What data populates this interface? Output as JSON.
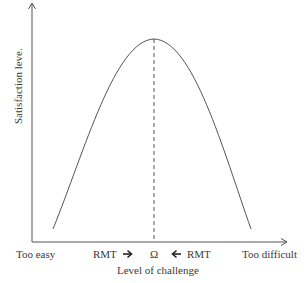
{
  "diagram": {
    "y_axis_label": "Satisfaction leve.",
    "x_axis_label": "Level of challenge",
    "x_left_label": "Too easy",
    "x_right_label": "Too difficult",
    "center_label": "Ω",
    "left_marker_label": "RMT",
    "right_marker_label": "RMT",
    "left_arrow_glyph": "➔",
    "right_arrow_glyph": "🡐",
    "colors": {
      "line": "#555555",
      "text": "#3a3a3a",
      "background": "#ffffff"
    },
    "curve": {
      "shape": "inverted-parabola",
      "peak_label": "Ω",
      "description": "Satisfaction peaks at optimal challenge level Ω; RMT moves challenge toward Ω from both sides"
    }
  }
}
